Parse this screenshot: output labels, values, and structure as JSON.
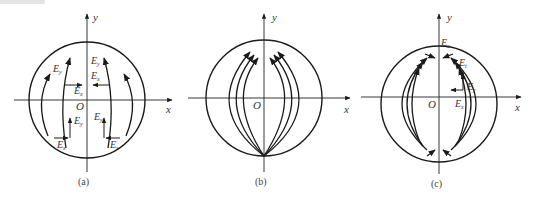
{
  "figure": {
    "panels": [
      {
        "id": "a",
        "caption": "(a)",
        "axes": {
          "x": "x",
          "y": "y",
          "origin": "O"
        },
        "labels": [
          {
            "text": "E",
            "sub": "y",
            "pos": "upper-left"
          },
          {
            "text": "E",
            "sub": "y",
            "pos": "upper-center-right"
          },
          {
            "text": "E",
            "sub": "x",
            "pos": "upper-right"
          },
          {
            "text": "E",
            "sub": "x",
            "pos": "center-left"
          },
          {
            "text": "E",
            "sub": "y",
            "pos": "lower-left"
          },
          {
            "text": "E",
            "sub": "y",
            "pos": "lower-right"
          },
          {
            "text": "E",
            "sub": "x",
            "pos": "bottom-left"
          },
          {
            "text": "E",
            "sub": "x",
            "pos": "bottom-right"
          }
        ]
      },
      {
        "id": "b",
        "caption": "(b)",
        "axes": {
          "x": "x",
          "y": "y",
          "origin": "O"
        },
        "labels": []
      },
      {
        "id": "c",
        "caption": "(c)",
        "axes": {
          "x": "x",
          "y": "y",
          "origin": "O"
        },
        "labels": [
          {
            "text": "E",
            "sub": "x",
            "pos": "top"
          },
          {
            "text": "E",
            "sub": "t",
            "pos": "upper-right"
          },
          {
            "text": "E",
            "sub": "y",
            "pos": "right"
          },
          {
            "text": "E",
            "sub": "x",
            "pos": "right-below-axis"
          }
        ]
      }
    ]
  },
  "colors": {
    "line": "#1a1a1a",
    "text": "#333333",
    "background": "#ffffff"
  }
}
